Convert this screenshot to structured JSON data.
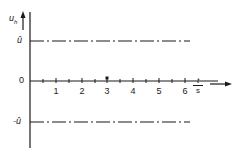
{
  "diagram": {
    "y_axis": {
      "label": "u",
      "label_sub": "h"
    },
    "x_axis": {
      "label_numerator": "t",
      "label_denominator": "s"
    },
    "levels": [
      {
        "name": "upper",
        "label": "û",
        "value": "û"
      },
      {
        "name": "zero",
        "label": "0",
        "value": 0
      },
      {
        "name": "lower",
        "label": "-û",
        "value": "-û"
      }
    ],
    "ticks": [
      {
        "label": "1",
        "x": 56
      },
      {
        "label": "2",
        "x": 82
      },
      {
        "label": "3",
        "x": 107
      },
      {
        "label": "4",
        "x": 133
      },
      {
        "label": "5",
        "x": 159
      },
      {
        "label": "6",
        "x": 185
      }
    ],
    "line_style": "dash-dot",
    "line_color": "#1a1a1a"
  }
}
